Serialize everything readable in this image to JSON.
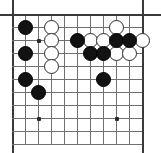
{
  "figure": {
    "board_size": 11,
    "visible_region": "upper-left portion of a go board",
    "width_px": 161,
    "height_px": 153
  },
  "board": {
    "geometry": {
      "origin_x": 12,
      "origin_y": 14,
      "cell": 13,
      "cols": 11,
      "rows": 11,
      "stone_diameter": 15
    },
    "colors": {
      "background": "#ffffff",
      "grid_line": "#6f6f6f",
      "edge_line": "#3a3a3a",
      "black_stone": "#121212",
      "white_stone": "#ffffff",
      "white_stone_border": "#2b2b2b",
      "star_point": "#2a2a2a"
    },
    "star_points": [
      {
        "col": 2,
        "row": 2
      },
      {
        "col": 2,
        "row": 8
      },
      {
        "col": 8,
        "row": 8
      }
    ],
    "stones": [
      {
        "color": "black",
        "col": 1,
        "row": 1
      },
      {
        "color": "white",
        "col": 3,
        "row": 1
      },
      {
        "color": "white",
        "col": 3,
        "row": 2
      },
      {
        "color": "black",
        "col": 5,
        "row": 2
      },
      {
        "color": "white",
        "col": 6,
        "row": 2
      },
      {
        "color": "white",
        "col": 7,
        "row": 2
      },
      {
        "color": "black",
        "col": 8,
        "row": 2
      },
      {
        "color": "black",
        "col": 9,
        "row": 2
      },
      {
        "color": "white",
        "col": 10,
        "row": 2
      },
      {
        "color": "white",
        "col": 8,
        "row": 1
      },
      {
        "color": "black",
        "col": 1,
        "row": 3
      },
      {
        "color": "white",
        "col": 3,
        "row": 3
      },
      {
        "color": "black",
        "col": 6,
        "row": 3
      },
      {
        "color": "black",
        "col": 7,
        "row": 3
      },
      {
        "color": "white",
        "col": 8,
        "row": 3
      },
      {
        "color": "white",
        "col": 9,
        "row": 3
      },
      {
        "color": "white",
        "col": 3,
        "row": 4
      },
      {
        "color": "black",
        "col": 1,
        "row": 5
      },
      {
        "color": "black",
        "col": 7,
        "row": 5
      },
      {
        "color": "black",
        "col": 2,
        "row": 6
      }
    ]
  }
}
